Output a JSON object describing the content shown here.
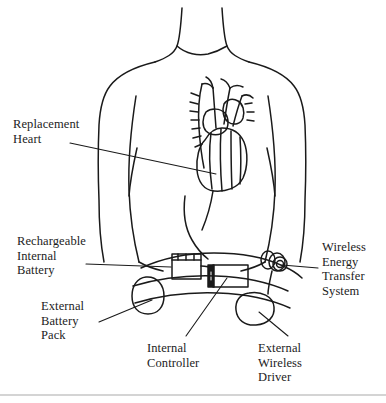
{
  "figure": {
    "background_color": "#ffffff",
    "line_color": "#1a1a1a",
    "rule_color": "#d4d4d4"
  },
  "labels": {
    "replacement_heart": "Replacement\nHeart",
    "rechargeable_internal_battery": "Rechargeable\nInternal\nBattery",
    "external_battery_pack": "External\nBattery\nPack",
    "wireless_energy_transfer_system": "Wireless\nEnergy\nTransfer\nSystem",
    "internal_controller": "Internal\nController",
    "external_wireless_driver": "External\nWireless\nDriver"
  },
  "parts": [
    {
      "name": "replacement-heart",
      "kind": "implanted-organ"
    },
    {
      "name": "rechargeable-internal-battery",
      "kind": "implanted-device"
    },
    {
      "name": "internal-controller",
      "kind": "implanted-device"
    },
    {
      "name": "wireless-energy-transfer-system",
      "kind": "implanted-coil"
    },
    {
      "name": "external-battery-pack",
      "kind": "worn-device"
    },
    {
      "name": "external-wireless-driver",
      "kind": "worn-device"
    }
  ]
}
